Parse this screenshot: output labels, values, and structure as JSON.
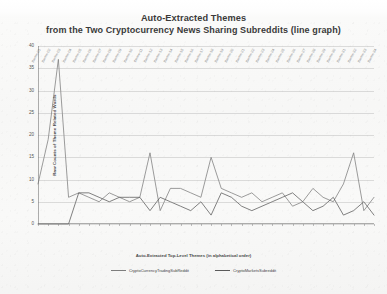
{
  "title": {
    "line1": "Auto-Extracted Themes",
    "line2": "from the Two Cryptocurrency News Sharing Subreddits (line graph)"
  },
  "chart_data": {
    "type": "line",
    "xlabel": "Auto-Extracted Top-Level Themes (in alphabetical order)",
    "ylabel": "Raw Counts of Theme Related Words",
    "ylim": [
      0,
      40
    ],
    "yticks": [
      0,
      5,
      10,
      15,
      20,
      25,
      30,
      35,
      40
    ],
    "grid": "horizontal",
    "legend_position": "bottom",
    "categories": [
      "theme-01",
      "theme-02",
      "theme-03",
      "theme-04",
      "theme-05",
      "theme-06",
      "theme-07",
      "theme-08",
      "theme-09",
      "theme-10",
      "theme-11",
      "theme-12",
      "theme-13",
      "theme-14",
      "theme-15",
      "theme-16",
      "theme-17",
      "theme-18",
      "theme-19",
      "theme-20",
      "theme-21",
      "theme-22",
      "theme-23",
      "theme-24",
      "theme-25",
      "theme-26",
      "theme-27",
      "theme-28",
      "theme-29",
      "theme-30",
      "theme-31",
      "theme-32",
      "theme-33",
      "theme-34"
    ],
    "series": [
      {
        "name": "CryptoCurrencyTradingSubReddit",
        "color": "#7d7d7d",
        "values": [
          9,
          19,
          37,
          6,
          7,
          6,
          5,
          7,
          6,
          5,
          6,
          16,
          3,
          8,
          8,
          7,
          6,
          15,
          8,
          7,
          6,
          7,
          5,
          6,
          7,
          4,
          5,
          8,
          6,
          5,
          9,
          16,
          3,
          6
        ]
      },
      {
        "name": "CryptoMarketsSubreddit",
        "color": "#5a5a5a",
        "values": [
          0,
          0,
          0,
          0,
          7,
          7,
          6,
          5,
          6,
          6,
          6,
          3,
          6,
          5,
          4,
          3,
          5,
          2,
          7,
          6,
          4,
          3,
          4,
          5,
          6,
          7,
          5,
          3,
          4,
          6,
          2,
          3,
          5,
          2
        ]
      }
    ]
  },
  "legend": [
    {
      "label": "CryptoCurrencyTradingSubReddit",
      "color": "#7d7d7d"
    },
    {
      "label": "CryptoMarketsSubreddit",
      "color": "#5a5a5a"
    }
  ]
}
